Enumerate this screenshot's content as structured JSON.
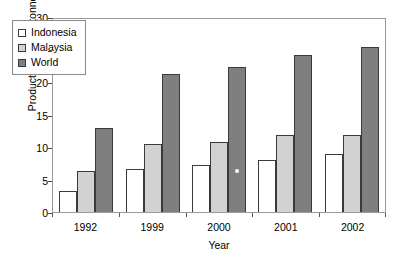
{
  "chart_data": {
    "type": "bar",
    "title": "",
    "xlabel": "Year",
    "ylabel": "Production (million tonnes)",
    "categories": [
      "1992",
      "1999",
      "2000",
      "2001",
      "2002"
    ],
    "series": [
      {
        "name": "Indonesia",
        "color": "#ffffff",
        "values": [
          3.3,
          6.6,
          7.3,
          8.0,
          9.0
        ]
      },
      {
        "name": "Malaysia",
        "color": "#d2d2d2",
        "values": [
          6.3,
          10.4,
          10.7,
          11.8,
          11.8
        ]
      },
      {
        "name": "World",
        "color": "#7f7f7f",
        "values": [
          12.9,
          21.2,
          22.3,
          24.1,
          25.4
        ]
      }
    ],
    "ylim": [
      0,
      30
    ],
    "yticks": [
      0,
      5,
      10,
      15,
      20,
      25,
      30
    ],
    "ytick_labels": [
      "0",
      "5",
      "10",
      "15",
      "20",
      "25",
      "30"
    ],
    "grid": false,
    "legend_position": "upper-left-inside",
    "frame": true,
    "bar_border_color": "#3a3a3a",
    "frame_color": "#9a9a9a",
    "axis_text_color": "#000000"
  },
  "legend": {
    "entries": [
      "Indonesia",
      "Malaysia",
      "World"
    ]
  }
}
